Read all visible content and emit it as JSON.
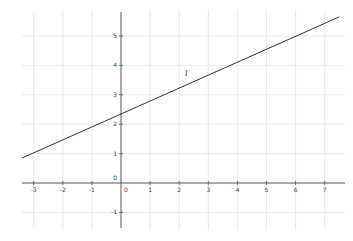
{
  "chart_data": {
    "type": "line",
    "title": "",
    "xlabel": "",
    "ylabel": "",
    "xlim": [
      -3.4,
      7.5
    ],
    "ylim": [
      -1.5,
      5.9
    ],
    "grid": true,
    "x_ticks": [
      "-3",
      "-2",
      "-1",
      "0",
      "1",
      "2",
      "3",
      "4",
      "5",
      "6",
      "7"
    ],
    "y_ticks": [
      "-1",
      "0",
      "1",
      "2",
      "3",
      "4",
      "5"
    ],
    "series": [
      {
        "name": "l",
        "slope": 0.44,
        "intercept": 2.35,
        "x": [
          -3.4,
          7.5
        ],
        "y": [
          0.85,
          5.65
        ]
      }
    ],
    "annotations": [
      {
        "text": "l",
        "x": 2.2,
        "y": 3.65
      }
    ],
    "colors": {
      "line": "#333333",
      "axis": "#555555",
      "grid": "#e4e4e4"
    }
  }
}
